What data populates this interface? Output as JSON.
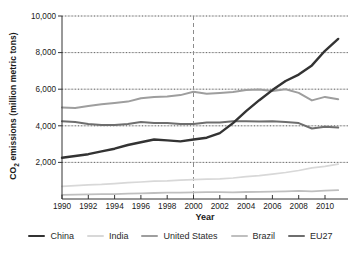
{
  "chart_data": {
    "type": "line",
    "title": "",
    "xlabel": "Year",
    "ylabel": "CO₂ emissions (million metric tons)",
    "ylabel_parts": {
      "prefix": "CO",
      "sub": "2",
      "rest": " emissions (million metric tons)"
    },
    "x": [
      1990,
      1991,
      1992,
      1993,
      1994,
      1995,
      1996,
      1997,
      1998,
      1999,
      2000,
      2001,
      2002,
      2003,
      2004,
      2005,
      2006,
      2007,
      2008,
      2009,
      2010,
      2011
    ],
    "x_tick_years": [
      1990,
      1992,
      1994,
      1996,
      1998,
      2000,
      2002,
      2004,
      2006,
      2008,
      2010
    ],
    "x_tick_labels": [
      "1990",
      "1992",
      "1994",
      "1996",
      "1998",
      "2000",
      "2002",
      "2004",
      "2006",
      "2008",
      "2010"
    ],
    "y_ticks": [
      2000,
      4000,
      6000,
      8000,
      10000
    ],
    "y_tick_labels": [
      "2,000",
      "4,000",
      "6,000",
      "8,000",
      "10,000"
    ],
    "xlim": [
      1990,
      2012
    ],
    "ylim": [
      0,
      10000
    ],
    "grid": "horizontal-dotted",
    "legend_position": "bottom",
    "reference_line": {
      "x": 2000,
      "style": "vertical-dashed"
    },
    "series": [
      {
        "name": "China",
        "color": "#333333",
        "width": 2.4,
        "values": [
          2250,
          2350,
          2450,
          2600,
          2750,
          2950,
          3100,
          3250,
          3200,
          3150,
          3250,
          3350,
          3600,
          4150,
          4800,
          5400,
          5950,
          6450,
          6800,
          7300,
          8100,
          8750
        ]
      },
      {
        "name": "India",
        "color": "#d8d8d8",
        "width": 1.7,
        "values": [
          690,
          730,
          770,
          800,
          840,
          890,
          930,
          970,
          990,
          1030,
          1060,
          1080,
          1100,
          1150,
          1220,
          1280,
          1360,
          1450,
          1560,
          1700,
          1780,
          1900
        ]
      },
      {
        "name": "United States",
        "color": "#9e9e9e",
        "width": 2.0,
        "values": [
          5000,
          4980,
          5080,
          5180,
          5250,
          5320,
          5500,
          5580,
          5600,
          5680,
          5860,
          5750,
          5800,
          5850,
          5950,
          5990,
          5900,
          6000,
          5800,
          5390,
          5580,
          5450
        ]
      },
      {
        "name": "Brazil",
        "color": "#bfbfbf",
        "width": 1.8,
        "values": [
          230,
          240,
          250,
          260,
          270,
          290,
          310,
          330,
          345,
          350,
          360,
          370,
          370,
          365,
          380,
          390,
          400,
          420,
          440,
          420,
          460,
          480
        ]
      },
      {
        "name": "EU27",
        "color": "#6e6e6e",
        "width": 2.0,
        "values": [
          4250,
          4200,
          4100,
          4050,
          4050,
          4100,
          4200,
          4150,
          4150,
          4100,
          4100,
          4180,
          4180,
          4250,
          4250,
          4230,
          4250,
          4200,
          4150,
          3850,
          3950,
          3900
        ]
      }
    ],
    "colors": {
      "axis": "#333333",
      "grid_solid": "#c6c6c6",
      "grid_dotted": "#5a5a5a",
      "reference_line": "#8c8c8c",
      "tick_text": "#1a1a1a"
    }
  }
}
